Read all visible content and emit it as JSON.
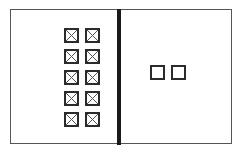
{
  "diagram": {
    "frame": {
      "x": 10,
      "y": 9,
      "width": 222,
      "height": 135,
      "color": "#555555"
    },
    "divider": {
      "x": 117,
      "width": 4,
      "color": "#1a1a1a"
    },
    "left_panel": {
      "label": "",
      "box_style": "crossed",
      "rows": 5,
      "cols": 2,
      "count": 10,
      "boxes": [
        {
          "x": 64,
          "y": 28
        },
        {
          "x": 85,
          "y": 28
        },
        {
          "x": 64,
          "y": 49
        },
        {
          "x": 85,
          "y": 49
        },
        {
          "x": 64,
          "y": 70
        },
        {
          "x": 85,
          "y": 70
        },
        {
          "x": 64,
          "y": 91
        },
        {
          "x": 85,
          "y": 91
        },
        {
          "x": 64,
          "y": 112
        },
        {
          "x": 85,
          "y": 112
        }
      ]
    },
    "right_panel": {
      "label": "",
      "box_style": "empty",
      "rows": 1,
      "cols": 2,
      "count": 2,
      "boxes": [
        {
          "x": 150,
          "y": 65
        },
        {
          "x": 171,
          "y": 65
        }
      ]
    },
    "box_size": 15,
    "stroke_color": "#2b2b2b",
    "cross_color": "#555555"
  }
}
